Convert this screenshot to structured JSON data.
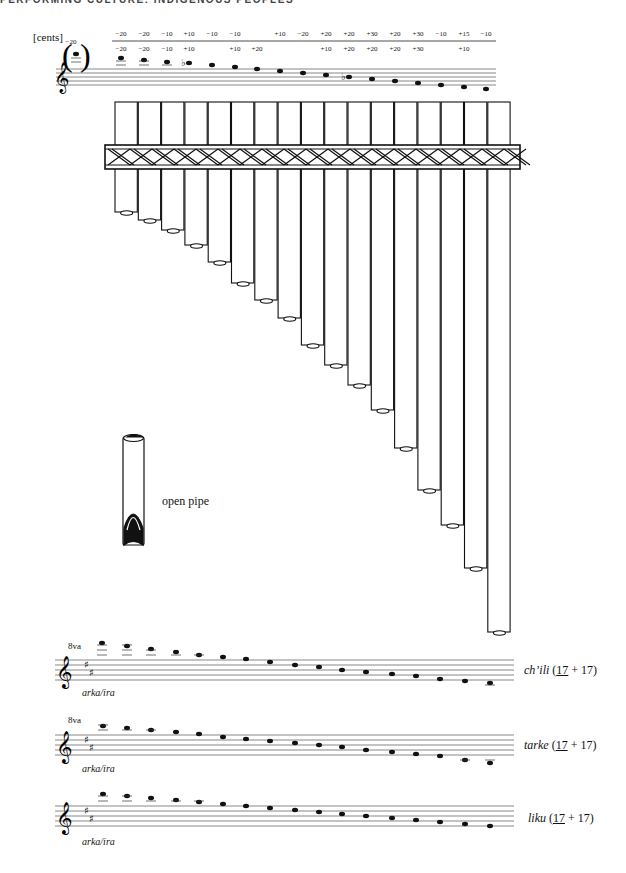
{
  "running_head": "PERFORMING CULTURE: INDIGENOUS PEOPLES",
  "top_staff": {
    "unit_label": "[cents]",
    "parenthetical_note_cents": "−20",
    "cents_row_top": [
      "−20",
      "−20",
      "−10",
      "+10",
      "−10",
      "−10",
      "",
      "+10",
      "−20",
      "+20",
      "+20",
      "+30",
      "+20",
      "+30",
      "−10",
      "+15",
      "−10"
    ],
    "cents_row_bottom": [
      "−20",
      "−20",
      "−10",
      "+10",
      "",
      "+10",
      "+20",
      "",
      "",
      "+10",
      "+20",
      "+20",
      "+20",
      "+30",
      "",
      "+10",
      ""
    ],
    "flats_at_notes": [
      4,
      10
    ]
  },
  "panpipe": {
    "pipe_count": 17,
    "caption": "open pipe"
  },
  "staves": [
    {
      "ottava": "8va",
      "sub_label": "arka/ira",
      "name": "ch’ili",
      "count_ira": "17",
      "count_arka": "17"
    },
    {
      "ottava": "8va",
      "sub_label": "arka/ira",
      "name": "tarke",
      "count_ira": "17",
      "count_arka": "17"
    },
    {
      "ottava": "",
      "sub_label": "arka/ira",
      "name": "liku",
      "count_ira": "17",
      "count_arka": "17"
    }
  ],
  "labels": {
    "chili_name": "ch’ili",
    "tarke_name": "tarke",
    "liku_name": "liku",
    "open": "(",
    "plus": " + ",
    "close": ")",
    "ira": "17",
    "arka": "17",
    "arkaira": "arka/ira",
    "ottava": "8va"
  }
}
